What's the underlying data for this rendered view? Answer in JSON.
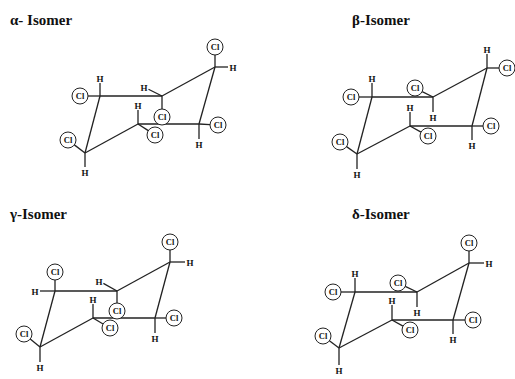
{
  "isomers": [
    {
      "id": "alpha",
      "title": "α- Isomer",
      "title_pos": [
        10,
        25
      ],
      "carbons": [
        [
          100,
          96
        ],
        [
          162,
          96
        ],
        [
          215,
          67
        ],
        [
          199,
          124
        ],
        [
          138,
          124
        ],
        [
          85,
          153
        ]
      ],
      "substituents": [
        {
          "c": 0,
          "atom": "H",
          "pos": [
            100,
            78
          ]
        },
        {
          "c": 0,
          "atom": "Cl",
          "pos": [
            80,
            96
          ]
        },
        {
          "c": 1,
          "atom": "H",
          "pos": [
            144,
            87
          ]
        },
        {
          "c": 1,
          "atom": "Cl",
          "pos": [
            162,
            117
          ]
        },
        {
          "c": 2,
          "atom": "Cl",
          "pos": [
            215,
            47
          ]
        },
        {
          "c": 2,
          "atom": "H",
          "pos": [
            233,
            67
          ]
        },
        {
          "c": 3,
          "atom": "Cl",
          "pos": [
            218,
            125
          ]
        },
        {
          "c": 3,
          "atom": "H",
          "pos": [
            199,
            144
          ]
        },
        {
          "c": 4,
          "atom": "H",
          "pos": [
            138,
            105
          ]
        },
        {
          "c": 4,
          "atom": "Cl",
          "pos": [
            155,
            135
          ]
        },
        {
          "c": 5,
          "atom": "Cl",
          "pos": [
            68,
            140
          ]
        },
        {
          "c": 5,
          "atom": "H",
          "pos": [
            85,
            172
          ]
        }
      ]
    },
    {
      "id": "beta",
      "title": "β-Isomer",
      "title_pos": [
        352,
        25
      ],
      "carbons": [
        [
          372,
          97
        ],
        [
          433,
          97
        ],
        [
          487,
          68
        ],
        [
          472,
          126
        ],
        [
          410,
          126
        ],
        [
          357,
          154
        ]
      ],
      "substituents": [
        {
          "c": 0,
          "atom": "H",
          "pos": [
            372,
            78
          ]
        },
        {
          "c": 0,
          "atom": "Cl",
          "pos": [
            351,
            97
          ]
        },
        {
          "c": 1,
          "atom": "Cl",
          "pos": [
            415,
            88
          ]
        },
        {
          "c": 1,
          "atom": "H",
          "pos": [
            433,
            117
          ]
        },
        {
          "c": 2,
          "atom": "H",
          "pos": [
            487,
            49
          ]
        },
        {
          "c": 2,
          "atom": "Cl",
          "pos": [
            507,
            68
          ]
        },
        {
          "c": 3,
          "atom": "Cl",
          "pos": [
            491,
            126
          ]
        },
        {
          "c": 3,
          "atom": "H",
          "pos": [
            472,
            145
          ]
        },
        {
          "c": 4,
          "atom": "H",
          "pos": [
            410,
            107
          ]
        },
        {
          "c": 4,
          "atom": "Cl",
          "pos": [
            428,
            136
          ]
        },
        {
          "c": 5,
          "atom": "Cl",
          "pos": [
            340,
            142
          ]
        },
        {
          "c": 5,
          "atom": "H",
          "pos": [
            357,
            174
          ]
        }
      ]
    },
    {
      "id": "gamma",
      "title": "γ-Isomer",
      "title_pos": [
        10,
        219
      ],
      "carbons": [
        [
          55,
          291
        ],
        [
          117,
          291
        ],
        [
          170,
          262
        ],
        [
          155,
          318
        ],
        [
          93,
          318
        ],
        [
          40,
          347
        ]
      ],
      "substituents": [
        {
          "c": 0,
          "atom": "Cl",
          "pos": [
            55,
            272
          ]
        },
        {
          "c": 0,
          "atom": "H",
          "pos": [
            35,
            291
          ]
        },
        {
          "c": 1,
          "atom": "H",
          "pos": [
            99,
            281
          ]
        },
        {
          "c": 1,
          "atom": "Cl",
          "pos": [
            117,
            311
          ]
        },
        {
          "c": 2,
          "atom": "Cl",
          "pos": [
            170,
            242
          ]
        },
        {
          "c": 2,
          "atom": "H",
          "pos": [
            190,
            262
          ]
        },
        {
          "c": 3,
          "atom": "Cl",
          "pos": [
            174,
            318
          ]
        },
        {
          "c": 3,
          "atom": "H",
          "pos": [
            155,
            338
          ]
        },
        {
          "c": 4,
          "atom": "H",
          "pos": [
            93,
            299
          ]
        },
        {
          "c": 4,
          "atom": "Cl",
          "pos": [
            110,
            328
          ]
        },
        {
          "c": 5,
          "atom": "Cl",
          "pos": [
            24,
            334
          ]
        },
        {
          "c": 5,
          "atom": "H",
          "pos": [
            40,
            367
          ]
        }
      ]
    },
    {
      "id": "delta",
      "title": "δ-Isomer",
      "title_pos": [
        352,
        219
      ],
      "carbons": [
        [
          355,
          292
        ],
        [
          417,
          292
        ],
        [
          469,
          263
        ],
        [
          453,
          320
        ],
        [
          392,
          320
        ],
        [
          339,
          348
        ]
      ],
      "substituents": [
        {
          "c": 0,
          "atom": "H",
          "pos": [
            355,
            273
          ]
        },
        {
          "c": 0,
          "atom": "Cl",
          "pos": [
            333,
            292
          ]
        },
        {
          "c": 1,
          "atom": "Cl",
          "pos": [
            398,
            283
          ]
        },
        {
          "c": 1,
          "atom": "H",
          "pos": [
            417,
            312
          ]
        },
        {
          "c": 2,
          "atom": "Cl",
          "pos": [
            469,
            243
          ]
        },
        {
          "c": 2,
          "atom": "H",
          "pos": [
            489,
            263
          ]
        },
        {
          "c": 3,
          "atom": "Cl",
          "pos": [
            473,
            320
          ]
        },
        {
          "c": 3,
          "atom": "H",
          "pos": [
            453,
            339
          ]
        },
        {
          "c": 4,
          "atom": "H",
          "pos": [
            392,
            300
          ]
        },
        {
          "c": 4,
          "atom": "Cl",
          "pos": [
            410,
            330
          ]
        },
        {
          "c": 5,
          "atom": "Cl",
          "pos": [
            323,
            336
          ]
        },
        {
          "c": 5,
          "atom": "H",
          "pos": [
            339,
            370
          ]
        }
      ]
    }
  ]
}
